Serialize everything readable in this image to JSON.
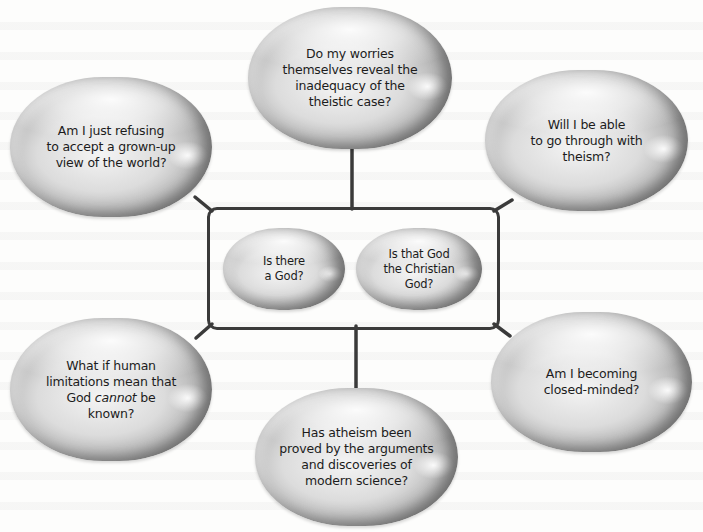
{
  "diagram": {
    "type": "concept-map",
    "center_group": {
      "items": [
        {
          "id": "is-there-a-god",
          "text": "Is there\na God?"
        },
        {
          "id": "is-that-god-christian",
          "text": "Is that God\nthe Christian\nGod?"
        }
      ]
    },
    "outer_bubbles": [
      {
        "id": "grown-up-view",
        "position": "top-left",
        "text": "Am I just refusing\nto accept a grown-up\nview of the world?"
      },
      {
        "id": "worries-reveal",
        "position": "top-center",
        "text": "Do my worries\nthemselves reveal the\ninadequacy of the\ntheistic case?"
      },
      {
        "id": "go-through-theism",
        "position": "top-right",
        "text": "Will I be able\nto go through with\ntheism?"
      },
      {
        "id": "human-limitations",
        "position": "bottom-left",
        "text": "What if human\nlimitations mean that\nGod cannot be\nknown?",
        "emphasis": "cannot"
      },
      {
        "id": "atheism-proved",
        "position": "bottom-center",
        "text": "Has atheism been\nproved by the arguments\nand discoveries of\nmodern science?"
      },
      {
        "id": "closed-minded",
        "position": "bottom-right",
        "text": "Am I becoming\nclosed-minded?"
      }
    ],
    "connections": [
      {
        "from": "center_group",
        "to": "grown-up-view"
      },
      {
        "from": "center_group",
        "to": "worries-reveal"
      },
      {
        "from": "center_group",
        "to": "go-through-theism"
      },
      {
        "from": "center_group",
        "to": "human-limitations"
      },
      {
        "from": "center_group",
        "to": "atheism-proved"
      },
      {
        "from": "center_group",
        "to": "closed-minded"
      }
    ],
    "colors": {
      "connector": "#3a3a3a",
      "bubble_mid": "#d6d6d6",
      "bubble_edge": "#7b7b7b",
      "text": "#1c1c1c",
      "background": "#fdfdfc"
    }
  }
}
